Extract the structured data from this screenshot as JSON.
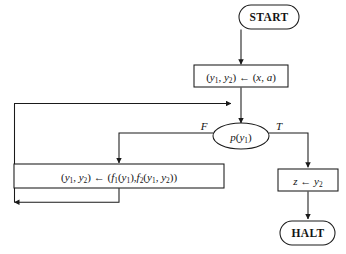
{
  "diagram": {
    "type": "flowchart",
    "title": "",
    "orientation": "top-to-bottom",
    "background_color": "#ffffff",
    "line_color": "#1a1a1a",
    "text_color": "#141414"
  },
  "nodes": {
    "start": {
      "label": "START",
      "shape": "stadium",
      "x": 269,
      "y": 17,
      "width": 60,
      "height": 24
    },
    "init_assign": {
      "label_plain": "(y1, y2) ← (x, a)",
      "shape": "rectangle",
      "x": 241,
      "y": 76,
      "width": 94,
      "height": 22,
      "parts": {
        "open": "(",
        "var1": "y",
        "sub1": "1",
        "comma": ", ",
        "var2": "y",
        "sub2": "2",
        "close_arrow": ") ← (",
        "val1": "x",
        "comma2": ", ",
        "val2": "a",
        "end": ")"
      }
    },
    "decision": {
      "label_plain": "p(y1)",
      "shape": "ellipse",
      "x": 241,
      "y": 136,
      "width": 56,
      "height": 26,
      "parts": {
        "fn": "p",
        "open": "(",
        "var": "y",
        "sub": "1",
        "close": ")"
      }
    },
    "loop_body": {
      "label_plain": "(y1, y2) ← (f1(y1), f2(y1, y2))",
      "shape": "rectangle",
      "x": 119,
      "y": 176,
      "width": 210,
      "height": 24,
      "parts": {
        "open": "(",
        "var1": "y",
        "sub1": "1",
        "comma1": ", ",
        "var2": "y",
        "sub2": "2",
        "arrow": ") ← (",
        "f1": "f",
        "f1sub": "1",
        "f1arg_open": "(",
        "f1arg": "y",
        "f1argsub": "1",
        "f1arg_close": "),",
        "f2": "f",
        "f2sub": "2",
        "f2arg_open": "(",
        "f2arg1": "y",
        "f2arg1sub": "1",
        "f2comma": ", ",
        "f2arg2": "y",
        "f2arg2sub": "2",
        "f2arg_close": "))"
      }
    },
    "result_assign": {
      "label_plain": "z ← y2",
      "shape": "rectangle",
      "x": 308,
      "y": 180,
      "width": 60,
      "height": 22,
      "parts": {
        "var": "z",
        "arrow": " ← ",
        "val": "y",
        "sub": "2"
      }
    },
    "halt": {
      "label": "HALT",
      "shape": "stadium",
      "x": 308,
      "y": 233,
      "width": 55,
      "height": 24
    }
  },
  "edges": [
    {
      "name": "start-to-init",
      "from": "start",
      "to": "init_assign",
      "label": "",
      "arrow": true
    },
    {
      "name": "init-to-decision",
      "from": "init_assign",
      "to": "decision",
      "label": "",
      "arrow": true
    },
    {
      "name": "decision-false-to-loop-body",
      "from": "decision",
      "to": "loop_body",
      "label": "F",
      "arrow": true
    },
    {
      "name": "decision-true-to-result",
      "from": "decision",
      "to": "result_assign",
      "label": "T",
      "arrow": true
    },
    {
      "name": "result-to-halt",
      "from": "result_assign",
      "to": "halt",
      "label": "",
      "arrow": true
    },
    {
      "name": "loop-back-to-decision",
      "from": "loop_body",
      "to": "decision",
      "label": "",
      "arrow": true
    }
  ],
  "branch_labels": {
    "false": "F",
    "true": "T"
  }
}
